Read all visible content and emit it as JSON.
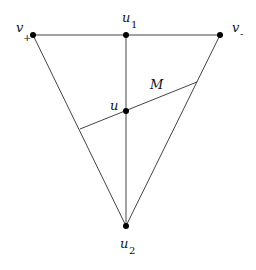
{
  "diagram": {
    "type": "triangle-graph",
    "colors": {
      "edge": "#444444",
      "node": "#000000",
      "text": "#111111",
      "background": "#ffffff"
    },
    "nodes": [
      {
        "id": "v_plus",
        "label": "v",
        "subscript": "+",
        "x": 33,
        "y": 35
      },
      {
        "id": "u1",
        "label": "u",
        "subscript": "1",
        "x": 126,
        "y": 35
      },
      {
        "id": "v_minus",
        "label": "v",
        "subscript": "-",
        "x": 220,
        "y": 35
      },
      {
        "id": "u",
        "label": "u",
        "subscript": "",
        "x": 126,
        "y": 111
      },
      {
        "id": "u2",
        "label": "u",
        "subscript": "2",
        "x": 126,
        "y": 226
      }
    ],
    "edges": [
      {
        "from": "v_plus",
        "to": "u1"
      },
      {
        "from": "u1",
        "to": "v_minus"
      },
      {
        "from": "v_plus",
        "to": "u2"
      },
      {
        "from": "v_minus",
        "to": "u2"
      },
      {
        "from": "u1",
        "to": "u2"
      }
    ],
    "segment_M": {
      "label": "M",
      "x1": 80,
      "y1": 129,
      "x2": 197,
      "y2": 82
    }
  }
}
